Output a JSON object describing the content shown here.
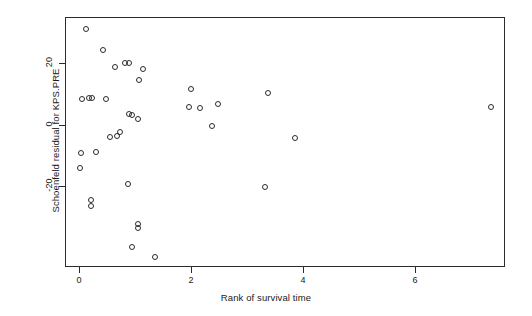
{
  "chart_data": {
    "type": "scatter",
    "title": "",
    "xlabel": "Rank of survival time",
    "ylabel": "Schoenfeld residual for KPS.PRE",
    "xlim": [
      -0.25,
      7.86
    ],
    "ylim": [
      -37.0,
      44.4
    ],
    "xticks": [
      0,
      2,
      4,
      6
    ],
    "xticklabels": [
      "0",
      "2",
      "4",
      "6"
    ],
    "yticks": [
      20,
      0,
      -20
    ],
    "yticklabels": [
      "20",
      "0",
      "-20"
    ],
    "grid": false,
    "legend": null,
    "marker": "open-circle",
    "marker_color": "#2b2b2b",
    "points": [
      {
        "x": 0.13,
        "y": 31.3
      },
      {
        "x": 0.43,
        "y": 24.4
      },
      {
        "x": 0.89,
        "y": 20.2
      },
      {
        "x": 0.82,
        "y": 20.2
      },
      {
        "x": 0.64,
        "y": 18.9
      },
      {
        "x": 1.14,
        "y": 18.2
      },
      {
        "x": 2.0,
        "y": 11.7
      },
      {
        "x": 1.96,
        "y": 5.9
      },
      {
        "x": 2.16,
        "y": 5.5
      },
      {
        "x": 2.48,
        "y": 6.8
      },
      {
        "x": 3.38,
        "y": 10.4
      },
      {
        "x": 1.07,
        "y": 14.7
      },
      {
        "x": 0.05,
        "y": 8.5
      },
      {
        "x": 0.18,
        "y": 8.8
      },
      {
        "x": 0.23,
        "y": 8.8
      },
      {
        "x": 0.48,
        "y": 8.5
      },
      {
        "x": 0.89,
        "y": 3.6
      },
      {
        "x": 0.95,
        "y": 3.3
      },
      {
        "x": 1.05,
        "y": 1.95
      },
      {
        "x": 0.55,
        "y": -3.9
      },
      {
        "x": 0.68,
        "y": -3.6
      },
      {
        "x": 0.73,
        "y": -2.3
      },
      {
        "x": 2.38,
        "y": -0.3
      },
      {
        "x": 3.86,
        "y": -4.2
      },
      {
        "x": 7.36,
        "y": 5.9
      },
      {
        "x": 0.3,
        "y": -8.8
      },
      {
        "x": 0.04,
        "y": -9.1
      },
      {
        "x": 0.02,
        "y": -14.0
      },
      {
        "x": 0.88,
        "y": -19.2
      },
      {
        "x": 0.21,
        "y": -24.4
      },
      {
        "x": 0.21,
        "y": -26.4
      },
      {
        "x": 1.05,
        "y": -32.2
      },
      {
        "x": 1.05,
        "y": -33.6
      },
      {
        "x": 3.32,
        "y": -20.2
      },
      {
        "x": 0.95,
        "y": -39.7
      },
      {
        "x": 1.36,
        "y": -43.0
      }
    ]
  },
  "axes": {
    "x_title": "Rank of survival time",
    "y_title": "Schoenfeld residual for KPS.PRE",
    "x_labels": [
      "0",
      "2",
      "4",
      "6"
    ],
    "y_labels": [
      "20",
      "0",
      "-20"
    ]
  }
}
